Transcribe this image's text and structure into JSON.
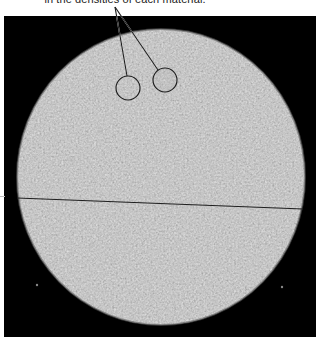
{
  "figure": {
    "caption_partial": "in the densities of each material.",
    "image_type": "CT scan cross-section of cylindrical phantom",
    "colors": {
      "background": "#000000",
      "phantom_gray": "#7a7a7a",
      "annotation_line": "#222222"
    },
    "annotations": {
      "circles": [
        {
          "label": "region-left",
          "cx": 128,
          "cy": 88,
          "r": 12
        },
        {
          "label": "region-right",
          "cx": 165,
          "cy": 80,
          "r": 12
        }
      ],
      "leader_origin": {
        "x": 115,
        "y": 7
      }
    }
  }
}
